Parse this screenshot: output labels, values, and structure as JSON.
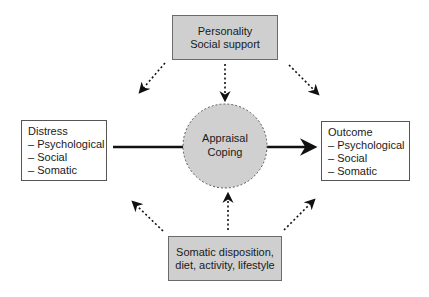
{
  "top_box": {
    "lines": [
      "Personality",
      "Social support"
    ]
  },
  "center": {
    "lines": [
      "Appraisal",
      "Coping"
    ]
  },
  "left_box": {
    "title": "Distress",
    "items": [
      "Psychological",
      "Social",
      "Somatic"
    ]
  },
  "right_box": {
    "title": "Outcome",
    "items": [
      "Psychological",
      "Social",
      "Somatic"
    ]
  },
  "bottom_box": {
    "lines": [
      "Somatic disposition,",
      "diet, activity, lifestyle"
    ]
  },
  "colors": {
    "box_fill": "#cfcfcf",
    "circle_fill": "#d0d0d0",
    "arrow": "#111111"
  }
}
